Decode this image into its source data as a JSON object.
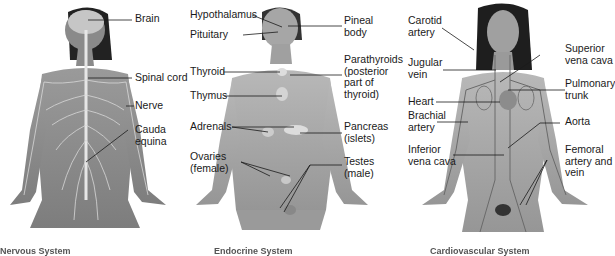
{
  "panels": [
    {
      "caption": "Nervous System",
      "labels": [
        "Brain",
        "Spinal cord",
        "Nerve",
        "Cauda\nequina"
      ]
    },
    {
      "caption": "Endocrine System",
      "labels": [
        "Hypothalamus",
        "Pituitary",
        "Pineal\nbody",
        "Thyroid",
        "Parathyroids\n(posterior\npart of\nthyroid)",
        "Thymus",
        "Adrenals",
        "Pancreas\n(islets)",
        "Ovaries\n(female)",
        "Testes\n(male)"
      ]
    },
    {
      "caption": "Cardiovascular System",
      "labels": [
        "Carotid\nartery",
        "Superior\nvena cava",
        "Jugular\nvein",
        "Pulmonary\ntrunk",
        "Heart",
        "Brachial\nartery",
        "Aorta",
        "Inferior\nvena cava",
        "Femoral\nartery and\nvein"
      ]
    }
  ]
}
